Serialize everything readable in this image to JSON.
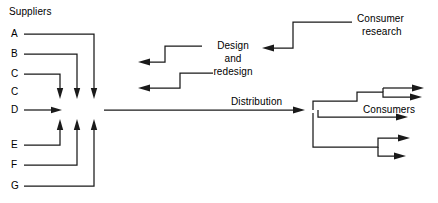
{
  "diagram": {
    "type": "flow-diagram",
    "background_color": "#ffffff",
    "line_color": "#1a1a1a",
    "text_color": "#000000"
  },
  "suppliers": {
    "heading": "Suppliers",
    "items": [
      {
        "label": "A"
      },
      {
        "label": "B"
      },
      {
        "label": "C"
      },
      {
        "label": "C"
      },
      {
        "label": "D"
      },
      {
        "label": "E"
      },
      {
        "label": "F"
      },
      {
        "label": "G"
      }
    ]
  },
  "process": {
    "design_line1": "Design",
    "design_line2": "and",
    "design_line3": "redesign",
    "consumer_research_line1": "Consumer",
    "consumer_research_line2": "research",
    "distribution": "Distribution",
    "consumers": "Consumers"
  }
}
